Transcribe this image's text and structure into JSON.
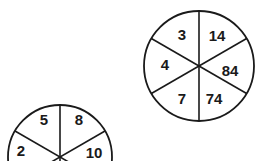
{
  "wheels": [
    {
      "id": "wheel-top-right",
      "segments": {
        "top_left": "3",
        "top_right": "14",
        "left": "4",
        "right": "84",
        "bottom_left": "7",
        "bottom_right": "74"
      }
    },
    {
      "id": "wheel-bottom-left",
      "segments": {
        "top_left": "5",
        "top_right": "8",
        "left": "2",
        "right": "10"
      }
    }
  ],
  "colors": {
    "line": "#1a1a1a",
    "background": "#ffffff"
  }
}
